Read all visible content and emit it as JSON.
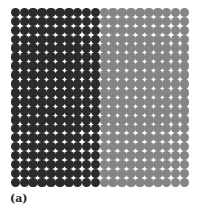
{
  "figure": {
    "label": "(a)",
    "grid": {
      "rows": 20,
      "columns": 20,
      "left_half_columns": 10,
      "right_half_columns": 10,
      "left_color": "#2b2b2b",
      "right_color": "#858585",
      "shape": "circle"
    }
  }
}
